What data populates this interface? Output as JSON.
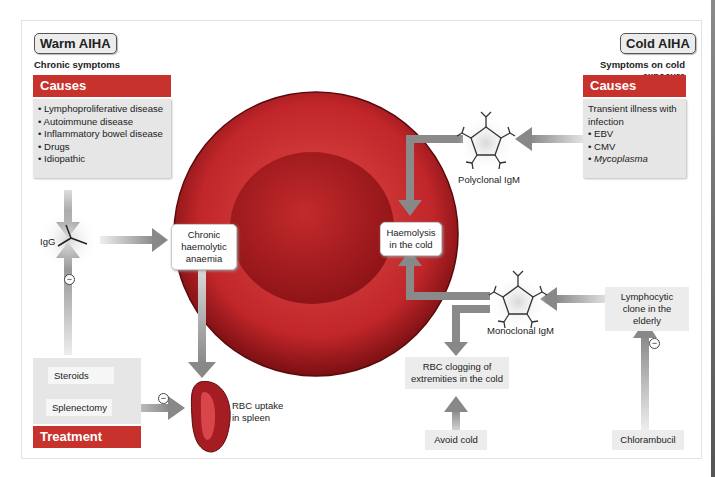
{
  "warm": {
    "title": "Warm AIHA",
    "subtitle": "Chronic symptoms",
    "causes_header": "Causes",
    "causes": [
      "Lymphoproliferative disease",
      "Autoimmune disease",
      "Inflammatory bowel disease",
      "Drugs",
      "Idiopathic"
    ],
    "antibody": "IgG",
    "outcome": "Chronic haemolytic anaemia",
    "spleen_label": "RBC uptake in spleen",
    "treatment_header": "Treatment",
    "treatments": [
      "Steroids",
      "Splenectomy"
    ],
    "inhibit_symbol": "−"
  },
  "cold": {
    "title": "Cold AIHA",
    "subtitle": "Symptoms on cold exposure",
    "causes_header": "Causes",
    "causes_intro": "Transient illness with infection",
    "causes": [
      "EBV",
      "CMV",
      "Mycoplasma"
    ],
    "polyclonal": "Polyclonal IgM",
    "haemolysis": "Haemolysis in the cold",
    "monoclonal": "Monoclonal IgM",
    "clone": "Lymphocytic clone in the elderly",
    "clogging": "RBC clogging of extremities in the cold",
    "avoid": "Avoid cold",
    "chlorambucil": "Chlorambucil",
    "inhibit_symbol": "−"
  },
  "colors": {
    "header_red": "#c8322d",
    "cell_red": "#b8282a",
    "arrow_grey": "#8a8a8a",
    "box_grey": "#e6e6e6"
  }
}
